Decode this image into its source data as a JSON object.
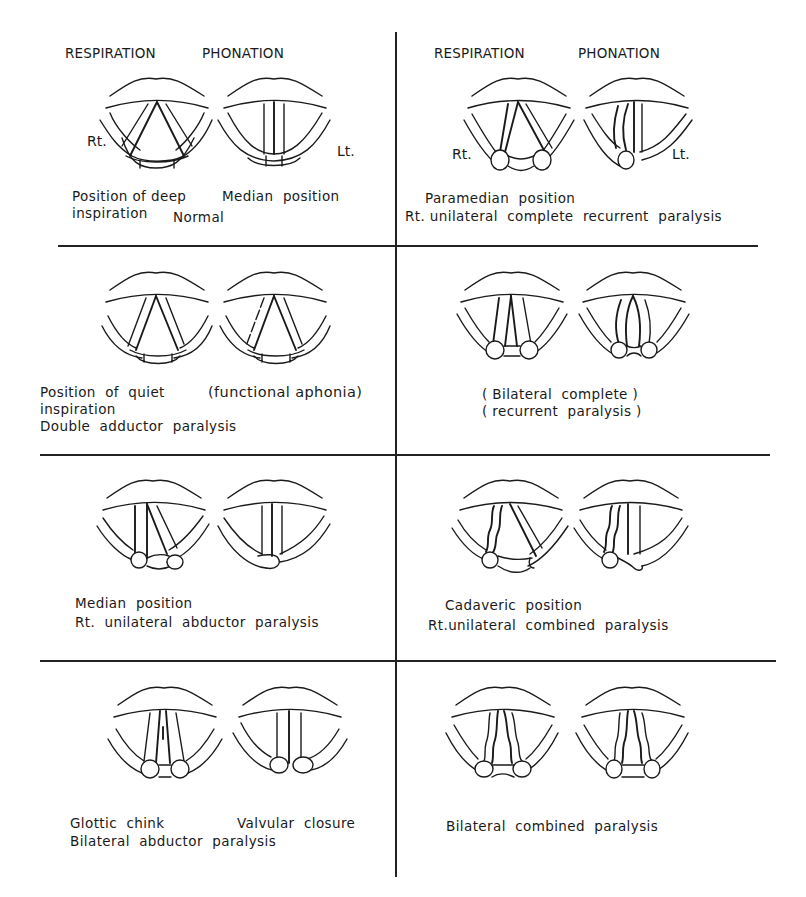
{
  "headers": {
    "left": {
      "respiration": "RESPIRATION",
      "phonation": "PHONATION"
    },
    "right": {
      "respiration": "RESPIRATION",
      "phonation": "PHONATION"
    }
  },
  "side_labels": {
    "right": "Rt.",
    "left": "Lt."
  },
  "panels": [
    {
      "id": "normal",
      "captions": {
        "respiration": "Position of deep\ninspiration",
        "phonation": "Median  position",
        "condition": "Normal"
      }
    },
    {
      "id": "rt-unilateral-complete-recurrent",
      "captions": {
        "position": "Paramedian  position",
        "condition": "Rt. unilateral  complete  recurrent  paralysis"
      }
    },
    {
      "id": "double-adductor",
      "captions": {
        "respiration": "Position  of  quiet\ninspiration",
        "phonation": "(functional aphonia)",
        "condition": "Double  adductor  paralysis"
      }
    },
    {
      "id": "bilateral-complete-recurrent",
      "captions": {
        "condition": "( Bilateral  complete )\n( recurrent  paralysis )"
      }
    },
    {
      "id": "rt-unilateral-abductor",
      "captions": {
        "position": "Median  position",
        "condition": "Rt.  unilateral  abductor  paralysis"
      }
    },
    {
      "id": "rt-unilateral-combined",
      "captions": {
        "position": "Cadaveric  position",
        "condition": "Rt.unilateral  combined  paralysis"
      }
    },
    {
      "id": "bilateral-abductor",
      "captions": {
        "respiration": "Glottic  chink",
        "phonation": "Valvular  closure",
        "condition": "Bilateral  abductor  paralysis"
      }
    },
    {
      "id": "bilateral-combined",
      "captions": {
        "condition": "Bilateral  combined  paralysis"
      }
    }
  ]
}
